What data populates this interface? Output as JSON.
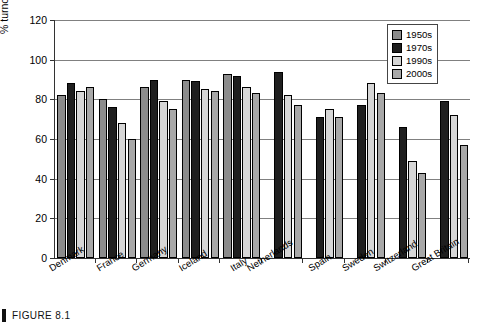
{
  "figure": {
    "caption": "FIGURE 8.1"
  },
  "chart_data": {
    "type": "bar",
    "title": "",
    "subtitle": "",
    "xlabel": "",
    "ylabel": "% turnout of registered voters",
    "ylim": [
      0,
      120
    ],
    "yticks": [
      0,
      20,
      40,
      60,
      80,
      100,
      120
    ],
    "grid": true,
    "legend_position": "top-right",
    "categories": [
      "Denmark",
      "France",
      "Germany",
      "Iceland",
      "Italy",
      "Netherlands",
      "Spain",
      "Sweden",
      "Switzerland",
      "Great Britain"
    ],
    "series": [
      {
        "name": "1950s",
        "color": "#8c8c8c",
        "values": [
          82,
          80,
          86,
          90,
          93,
          null,
          null,
          null,
          null,
          null
        ]
      },
      {
        "name": "1970s",
        "color": "#1f1f1f",
        "values": [
          88,
          76,
          90,
          89,
          92,
          94,
          71,
          77,
          66,
          79
        ]
      },
      {
        "name": "1990s",
        "color": "#d6d6d6",
        "values": [
          84,
          68,
          79,
          85,
          86,
          82,
          75,
          88,
          49,
          72
        ]
      },
      {
        "name": "2000s",
        "color": "#a8a8a8",
        "values": [
          86,
          60,
          75,
          84,
          83,
          77,
          71,
          83,
          43,
          57
        ]
      }
    ]
  }
}
